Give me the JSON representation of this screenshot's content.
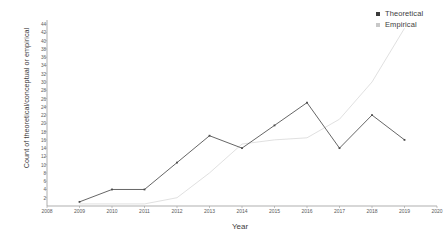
{
  "chart_data": {
    "type": "line",
    "title": "",
    "xlabel": "Year",
    "ylabel": "Count of theoretical/conceptual or empirical",
    "x": [
      2008,
      2009,
      2010,
      2011,
      2012,
      2013,
      2014,
      2015,
      2016,
      2017,
      2018,
      2019,
      2020
    ],
    "xlim": [
      2008,
      2020
    ],
    "ylim": [
      0,
      45
    ],
    "ytick_labels": [
      "44",
      "42",
      "40",
      "38",
      "36",
      "34",
      "32",
      "30",
      "28",
      "26",
      "24",
      "22",
      "20",
      "18",
      "16",
      "14",
      "12",
      "10",
      "8",
      "6",
      "4",
      "2"
    ],
    "ytick_values": [
      44,
      42,
      40,
      38,
      36,
      34,
      32,
      30,
      28,
      26,
      24,
      22,
      20,
      18,
      16,
      14,
      12,
      10,
      8,
      6,
      4,
      2
    ],
    "xtick_labels": [
      "2008",
      "2009",
      "2010",
      "2011",
      "2012",
      "2013",
      "2014",
      "2015",
      "2016",
      "2017",
      "2018",
      "2019",
      "2020"
    ],
    "grid": false,
    "legend_position": "top-right",
    "series": [
      {
        "name": "Theoretical",
        "color": "#4a4a4a",
        "marker": "square",
        "x": [
          2009,
          2010,
          2011,
          2012,
          2013,
          2014,
          2015,
          2016,
          2017,
          2018,
          2019
        ],
        "values": [
          1,
          4,
          4,
          10.5,
          17,
          14,
          19.5,
          25,
          14,
          22,
          16
        ]
      },
      {
        "name": "Empirical",
        "color": "#dcdcdc",
        "marker": "square",
        "x": [
          2009,
          2010,
          2011,
          2012,
          2013,
          2014,
          2015,
          2016,
          2017,
          2018,
          2019
        ],
        "values": [
          0.5,
          0.5,
          0.5,
          2,
          8,
          15,
          16,
          16.5,
          21,
          30,
          43
        ]
      }
    ]
  },
  "legend": {
    "items": [
      {
        "label": "Theoretical",
        "color": "#3a3a3a"
      },
      {
        "label": "Empirical",
        "color": "#c8c8c8"
      }
    ]
  },
  "axes": {
    "y_title": "Count of theoretical/conceptual or empirical",
    "x_title": "Year"
  }
}
